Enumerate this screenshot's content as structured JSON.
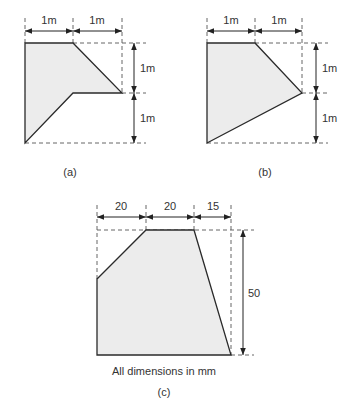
{
  "figures": [
    {
      "id": "a",
      "caption": "(a)",
      "horizontal_dims": [
        "1m",
        "1m"
      ],
      "vertical_dims": [
        "1m",
        "1m"
      ]
    },
    {
      "id": "b",
      "caption": "(b)",
      "horizontal_dims": [
        "1m",
        "1m"
      ],
      "vertical_dims": [
        "1m",
        "1m"
      ]
    },
    {
      "id": "c",
      "caption": "(c)",
      "horizontal_dims": [
        "20",
        "20",
        "15"
      ],
      "vertical_dims": [
        "50"
      ],
      "note": "All dimensions in mm"
    }
  ],
  "colors": {
    "fill": "#ececec",
    "stroke": "#2a2a2a"
  }
}
